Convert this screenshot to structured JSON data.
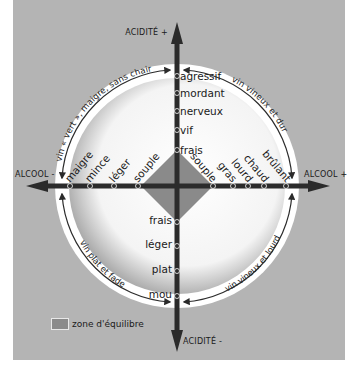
{
  "diagram": {
    "axes": {
      "acidite_plus": "ACIDITÉ +",
      "acidite_minus": "ACIDITÉ -",
      "alcool_minus": "ALCOOL -",
      "alcool_plus": "ALCOOL +"
    },
    "acidity_high": [
      "agressif",
      "mordant",
      "nerveux",
      "vif",
      "frais"
    ],
    "acidity_low": [
      "frais",
      "léger",
      "plat",
      "mou"
    ],
    "alcohol_low": [
      "maigre",
      "mince",
      "léger",
      "souple"
    ],
    "alcohol_high": [
      "souple",
      "gras",
      "lourd",
      "chaud",
      "brûlant"
    ],
    "quadrants": {
      "top_left": "vin « vert », maigre, sans chair",
      "top_right": "vin vineux et dur",
      "bottom_left": "vin plat et fade",
      "bottom_right": "vin vineux et lourd"
    },
    "legend": {
      "label": "zone d'équilibre",
      "color": "#8a8a8a"
    },
    "colors": {
      "background": "#b4b4b4",
      "axis": "#2b2b2b",
      "ring": "#ffffff"
    }
  }
}
